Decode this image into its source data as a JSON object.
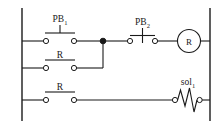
{
  "diagram": {
    "type": "ladder-logic-circuit",
    "title": "",
    "colors": {
      "background": "#ffffff",
      "line": "#1a1a1a",
      "terminal_fill": "#ffffff"
    },
    "rails": {
      "left_label": "",
      "right_label": ""
    },
    "rungs": [
      {
        "id": "rung-1",
        "elements": [
          {
            "name": "pb1-contact",
            "label": "PB",
            "subscript": "1",
            "kind": "normally-open-pushbutton"
          },
          {
            "name": "pb2-contact",
            "label": "PB",
            "subscript": "2",
            "kind": "normally-closed-pushbutton"
          },
          {
            "name": "relay-coil-r",
            "label": "R",
            "subscript": "",
            "kind": "coil"
          }
        ]
      },
      {
        "id": "rung-2",
        "elements": [
          {
            "name": "r-seal-in-contact",
            "label": "R",
            "subscript": "",
            "kind": "normally-open-contact"
          }
        ]
      },
      {
        "id": "rung-3",
        "elements": [
          {
            "name": "r-contact-rung3",
            "label": "R",
            "subscript": "",
            "kind": "normally-open-contact"
          },
          {
            "name": "solenoid-sol1",
            "label": "sol",
            "subscript": "1",
            "kind": "solenoid"
          }
        ]
      }
    ],
    "labels": {
      "pb1": "PB",
      "pb1_sub": "1",
      "pb2": "PB",
      "pb2_sub": "2",
      "r_coil": "R",
      "r_contact_rung2": "R",
      "r_contact_rung3": "R",
      "sol1": "sol",
      "sol1_sub": "1"
    }
  }
}
